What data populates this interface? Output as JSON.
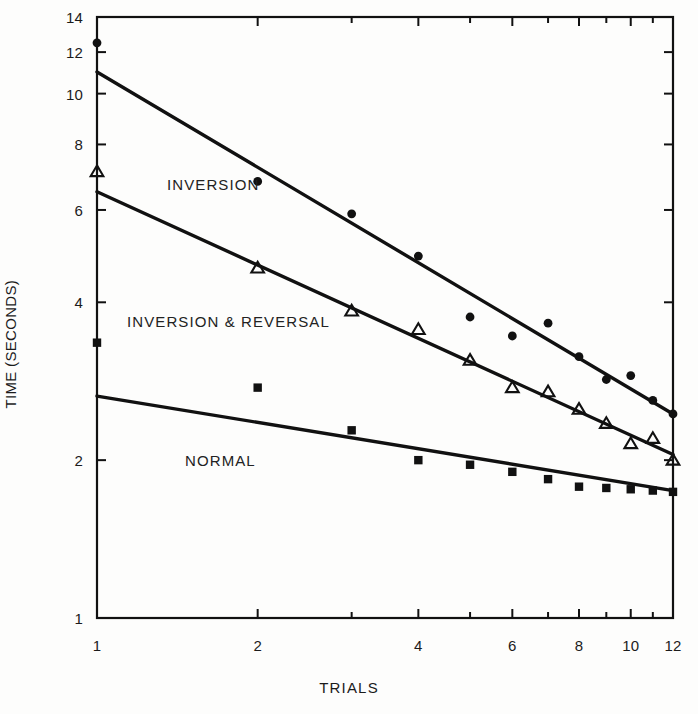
{
  "chart_data": {
    "type": "scatter",
    "title": "",
    "xlabel": "TRIALS",
    "ylabel": "TIME (SECONDS)",
    "xscale": "log",
    "yscale": "log",
    "xlim": [
      1,
      12
    ],
    "ylim": [
      1,
      14
    ],
    "grid": false,
    "legend_position": "inline-annotations",
    "xticks": [
      1,
      2,
      4,
      6,
      8,
      10,
      12
    ],
    "xtick_labels": [
      "1",
      "2",
      "4",
      "6",
      "8",
      "10",
      "12"
    ],
    "xminor_ticks": [
      3,
      5,
      7,
      9,
      11
    ],
    "yticks": [
      1,
      2,
      4,
      6,
      8,
      10,
      12,
      14
    ],
    "ytick_labels": [
      "1",
      "2",
      "4",
      "6",
      "8",
      "10",
      "12",
      "14"
    ],
    "series": [
      {
        "name": "INVERSION",
        "marker": "filled-circle",
        "color": "#111111",
        "x": [
          1,
          2,
          3,
          4,
          5,
          6,
          7,
          8,
          9,
          10,
          11,
          12
        ],
        "values": [
          12.5,
          6.8,
          5.9,
          4.9,
          3.75,
          3.45,
          3.65,
          3.15,
          2.85,
          2.9,
          2.6,
          2.45
        ],
        "fit_line": {
          "x": [
            1,
            12
          ],
          "y": [
            11.0,
            2.45
          ]
        }
      },
      {
        "name": "INVERSION & REVERSAL",
        "marker": "open-triangle",
        "color": "#111111",
        "x": [
          1,
          2,
          3,
          4,
          5,
          6,
          7,
          8,
          9,
          10,
          11,
          12
        ],
        "values": [
          7.1,
          4.65,
          3.85,
          3.55,
          3.1,
          2.75,
          2.7,
          2.5,
          2.35,
          2.15,
          2.2,
          2.0
        ],
        "fit_line": {
          "x": [
            1,
            12
          ],
          "y": [
            6.5,
            2.05
          ]
        }
      },
      {
        "name": "NORMAL",
        "marker": "filled-square",
        "color": "#111111",
        "x": [
          1,
          2,
          3,
          4,
          5,
          6,
          7,
          8,
          9,
          10,
          11,
          12
        ],
        "values": [
          3.35,
          2.75,
          2.28,
          2.0,
          1.96,
          1.9,
          1.84,
          1.78,
          1.77,
          1.76,
          1.75,
          1.74
        ],
        "fit_line": {
          "x": [
            1,
            12
          ],
          "y": [
            2.65,
            1.75
          ]
        }
      }
    ],
    "annotations": [
      {
        "text": "INVERSION",
        "x": 1.8,
        "y": 7.0
      },
      {
        "text": "INVERSION & REVERSAL",
        "x": 1.25,
        "y": 3.35
      },
      {
        "text": "NORMAL",
        "x": 1.9,
        "y": 2.12
      }
    ]
  },
  "axes": {
    "y_title": "TIME (SECONDS)",
    "x_title": "TRIALS",
    "y_tick_labels": [
      "14",
      "12",
      "10",
      "8",
      "6",
      "4",
      "2",
      "1"
    ],
    "x_tick_labels": [
      "1",
      "2",
      "4",
      "6",
      "8",
      "10",
      "12"
    ]
  },
  "labels": {
    "inversion": "INVERSION",
    "inversion_reversal": "INVERSION & REVERSAL",
    "normal": "NORMAL"
  },
  "colors": {
    "ink": "#111111",
    "paper": "#fdfdfc"
  }
}
